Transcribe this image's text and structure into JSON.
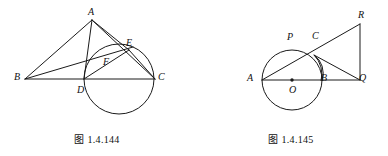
{
  "page": {
    "kind": "geometry-figure-sheet",
    "width": 388,
    "height": 156,
    "background_color": "#ffffff",
    "ink_color": "#1a1a1a"
  },
  "figures": [
    {
      "id": "figure-144",
      "caption": "图 1.4.144",
      "description": "Triangle ABC with cevian AD perpendicular to BC, a circle tangent to BC at D passing through E and F, segments AE, BE and AD drawn.",
      "vertex_labels": [
        {
          "name": "A",
          "text": "A",
          "x": 88,
          "y": 7
        },
        {
          "name": "B",
          "text": "B",
          "x": 14,
          "y": 72
        },
        {
          "name": "C",
          "text": "C",
          "x": 158,
          "y": 72
        },
        {
          "name": "D",
          "text": "D",
          "x": 77,
          "y": 85
        },
        {
          "name": "E",
          "text": "E",
          "x": 126,
          "y": 38
        },
        {
          "name": "F",
          "text": "F",
          "x": 103,
          "y": 57
        }
      ],
      "points": {
        "A": {
          "x": 92,
          "y": 20
        },
        "B": {
          "x": 25,
          "y": 79
        },
        "C": {
          "x": 155,
          "y": 79
        },
        "D": {
          "x": 84,
          "y": 79
        },
        "E": {
          "x": 129,
          "y": 50
        },
        "F": {
          "x": 109,
          "y": 62
        }
      },
      "circle": {
        "cx": 119,
        "cy": 79,
        "r": 35
      },
      "segments": [
        {
          "name": "segment-AB",
          "from": "A",
          "to": "B"
        },
        {
          "name": "segment-AC",
          "from": "A",
          "to": "C"
        },
        {
          "name": "segment-BC",
          "from": "B",
          "to": "C"
        },
        {
          "name": "segment-AD",
          "from": "A",
          "to": "D"
        },
        {
          "name": "segment-AE",
          "from": "A",
          "to": "E"
        },
        {
          "name": "segment-BE",
          "from": "B",
          "to": "E"
        },
        {
          "name": "segment-EC",
          "from": "E",
          "to": "C"
        },
        {
          "name": "segment-DE",
          "from": "D",
          "to": "E"
        }
      ]
    },
    {
      "id": "figure-145",
      "caption": "图 1.4.145",
      "description": "Circle with center O and diameter AB; line from A through P and C meets R; C joined to Q; RQ vertical tangent-like segment at Q; small arc from C toward B.",
      "vertex_labels": [
        {
          "name": "A",
          "text": "A",
          "x": 53,
          "y": 73
        },
        {
          "name": "O",
          "text": "O",
          "x": 95,
          "y": 85
        },
        {
          "name": "B",
          "text": "B",
          "x": 127,
          "y": 73
        },
        {
          "name": "P",
          "text": "P",
          "x": 93,
          "y": 32
        },
        {
          "name": "C",
          "text": "C",
          "x": 118,
          "y": 31
        },
        {
          "name": "R",
          "text": "R",
          "x": 164,
          "y": 10
        },
        {
          "name": "Q",
          "text": "Q",
          "x": 165,
          "y": 73
        }
      ],
      "points": {
        "A": {
          "x": 68,
          "y": 80
        },
        "O": {
          "x": 98,
          "y": 80
        },
        "B": {
          "x": 128,
          "y": 80
        },
        "P": {
          "x": 98,
          "y": 50
        },
        "C": {
          "x": 120,
          "y": 55
        },
        "R": {
          "x": 166,
          "y": 24
        },
        "Q": {
          "x": 166,
          "y": 80
        }
      },
      "circle": {
        "cx": 98,
        "cy": 80,
        "r": 30
      },
      "center_dot": {
        "cx": 98,
        "cy": 80,
        "r": 1.6
      },
      "segments": [
        {
          "name": "segment-AQ",
          "from": "A",
          "to": "Q"
        },
        {
          "name": "segment-AR",
          "from": "A",
          "to": "R"
        },
        {
          "name": "segment-CQ",
          "from": "C",
          "to": "Q"
        },
        {
          "name": "segment-RQ",
          "from": "R",
          "to": "Q"
        }
      ],
      "arcs": [
        {
          "name": "arc-CB",
          "from": "C",
          "to": "B"
        }
      ]
    }
  ]
}
